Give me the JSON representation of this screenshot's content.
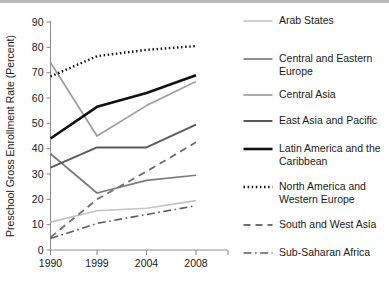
{
  "chart_data": {
    "type": "line",
    "title": "",
    "xlabel": "",
    "ylabel": "Preschool Gross Enrollment Rate (Percent)",
    "categories": [
      "1990",
      "1999",
      "2004",
      "2008"
    ],
    "x_tick_labels": [
      "1990",
      "1999",
      "2004",
      "2008"
    ],
    "y_tick_labels": [
      "0",
      "10",
      "20",
      "30",
      "40",
      "50",
      "60",
      "70",
      "80",
      "90"
    ],
    "y_ticks": [
      0,
      10,
      20,
      30,
      40,
      50,
      60,
      70,
      80,
      90
    ],
    "ylim": [
      0,
      90
    ],
    "grid": false,
    "legend_position": "right",
    "series": [
      {
        "name": "Arab States",
        "values": [
          11,
          15.5,
          16.5,
          19.5
        ],
        "color": "#c3c3c3",
        "dash": "none",
        "width": 1.6
      },
      {
        "name": "Central and Eastern Europe",
        "values": [
          38,
          22.5,
          27.5,
          29.5
        ],
        "color": "#7a7a7a",
        "dash": "none",
        "width": 1.7
      },
      {
        "name": "Central Asia",
        "values": [
          74,
          45,
          57,
          66.5
        ],
        "color": "#9d9d9d",
        "dash": "none",
        "width": 1.7
      },
      {
        "name": "East Asia and Pacific",
        "values": [
          32.5,
          40.5,
          40.5,
          49.5
        ],
        "color": "#5a5a5a",
        "dash": "none",
        "width": 2.0
      },
      {
        "name": "Latin America and the Caribbean",
        "values": [
          44,
          56.5,
          62,
          69
        ],
        "color": "#111111",
        "dash": "none",
        "width": 2.6
      },
      {
        "name": "North America and Western Europe",
        "values": [
          68.5,
          76.5,
          79,
          80.5
        ],
        "color": "#111111",
        "dash": "1.5,2.6",
        "width": 2.4
      },
      {
        "name": "South and West Asia",
        "values": [
          5,
          20,
          31,
          42.5
        ],
        "color": "#6f6f6f",
        "dash": "7,5",
        "width": 1.8
      },
      {
        "name": "Sub-Saharan Africa",
        "values": [
          4.5,
          10.5,
          14,
          17.5
        ],
        "color": "#5e5e5e",
        "dash": "8,3.5,1.6,3.5",
        "width": 1.6
      }
    ]
  },
  "legend": {
    "entries": [
      {
        "label": "Arab States",
        "lines": 1
      },
      {
        "label": "Central and Eastern\nEurope",
        "lines": 2
      },
      {
        "label": "Central Asia",
        "lines": 1
      },
      {
        "label": "East Asia and Pacific",
        "lines": 1
      },
      {
        "label": "Latin America and the\nCaribbean",
        "lines": 2
      },
      {
        "label": "North America and\nWestern Europe",
        "lines": 2
      },
      {
        "label": "South and West Asia",
        "lines": 1
      },
      {
        "label": "Sub-Saharan Africa",
        "lines": 1
      }
    ]
  },
  "axes": {
    "y_title": "Preschool Gross Enrollment Rate (Percent)"
  }
}
